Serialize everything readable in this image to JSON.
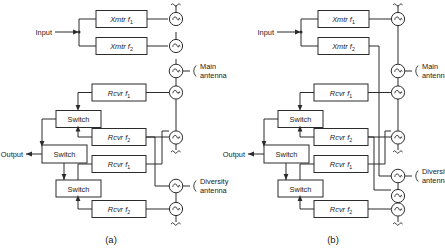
{
  "figure": {
    "type": "block-diagram",
    "panels": [
      {
        "id": "a",
        "caption": "(a)",
        "io": {
          "input_label": "Input",
          "output_label": "Output"
        },
        "antennas": [
          {
            "name": "main",
            "label_line1": "Main",
            "label_line2": "antenna"
          },
          {
            "name": "diversity",
            "label_line1": "Diversity",
            "label_line2": "antenna"
          }
        ],
        "transmitters": [
          {
            "name": "Xmtr",
            "freq": "f",
            "sub": "1",
            "label": "Xmtr f1"
          },
          {
            "name": "Xmtr",
            "freq": "f",
            "sub": "2",
            "label": "Xmtr f2"
          }
        ],
        "receivers": [
          {
            "name": "Rcvr",
            "freq": "f",
            "sub": "1",
            "label": "Rcvr f1"
          },
          {
            "name": "Rcvr",
            "freq": "f",
            "sub": "2",
            "label": "Rcvr f2"
          },
          {
            "name": "Rcvr",
            "freq": "f",
            "sub": "1",
            "label": "Rcvr f1"
          },
          {
            "name": "Rcvr",
            "freq": "f",
            "sub": "2",
            "label": "Rcvr f2"
          }
        ],
        "switches": [
          {
            "label": "Switch"
          },
          {
            "label": "Switch"
          },
          {
            "label": "Switch"
          }
        ]
      },
      {
        "id": "b",
        "caption": "(b)",
        "io": {
          "input_label": "Input",
          "output_label": "Output"
        },
        "antennas": [
          {
            "name": "main",
            "label_line1": "Main",
            "label_line2": "antenna"
          },
          {
            "name": "diversity",
            "label_line1": "Diversity",
            "label_line2": "antenna"
          }
        ],
        "transmitters": [
          {
            "name": "Xmtr",
            "freq": "f",
            "sub": "1",
            "label": "Xmtr f1"
          },
          {
            "name": "Xmtr",
            "freq": "f",
            "sub": "2",
            "label": "Xmtr f2"
          }
        ],
        "receivers": [
          {
            "name": "Rcvr",
            "freq": "f",
            "sub": "1",
            "label": "Rcvr f1"
          },
          {
            "name": "Rcvr",
            "freq": "f",
            "sub": "2",
            "label": "Rcvr f2"
          },
          {
            "name": "Rcvr",
            "freq": "f",
            "sub": "1",
            "label": "Rcvr f1"
          },
          {
            "name": "Rcvr",
            "freq": "f",
            "sub": "2",
            "label": "Rcvr f2"
          }
        ],
        "switches": [
          {
            "label": "Switch"
          },
          {
            "label": "Switch"
          },
          {
            "label": "Switch"
          }
        ]
      }
    ],
    "colors": {
      "line": "#2b2b2b",
      "background": "#ffffff",
      "text": "#1a1a1a"
    }
  }
}
